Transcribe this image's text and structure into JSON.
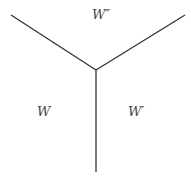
{
  "diagram": {
    "labels": {
      "top": "W″",
      "left": "W",
      "right": "W′"
    },
    "lines": [
      {
        "name": "left-branch",
        "x1": 11,
        "y1": 15,
        "x2": 96,
        "y2": 70
      },
      {
        "name": "right-branch",
        "x1": 185,
        "y1": 15,
        "x2": 96,
        "y2": 70
      },
      {
        "name": "vertical-branch",
        "x1": 96,
        "y1": 70,
        "x2": 96,
        "y2": 172
      }
    ],
    "stroke_color": "#333333"
  }
}
